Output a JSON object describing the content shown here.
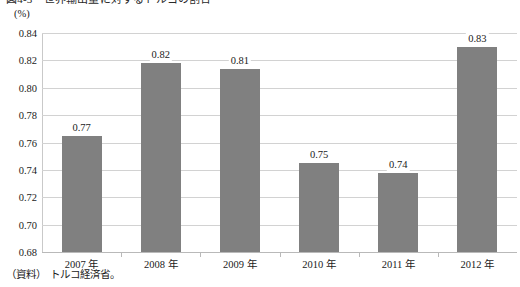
{
  "figure": {
    "title": "図4-3　世界輸出量に対するトルコの割合",
    "unit_label": "(%)",
    "source_label": "（資料）",
    "source_text": "トルコ経済省。"
  },
  "colors": {
    "bar_fill": "#808080",
    "gridline": "#d2d2d2",
    "axis": "#b9b9b9",
    "text": "#1a1a1a",
    "background": "#ffffff"
  },
  "chart_data": {
    "type": "bar",
    "title": "図4-3　世界輸出量に対するトルコの割合",
    "xlabel": "",
    "ylabel": "(%)",
    "ylim": [
      0.68,
      0.84
    ],
    "ytick_step": 0.02,
    "yticks": [
      "0.84",
      "0.82",
      "0.80",
      "0.78",
      "0.76",
      "0.74",
      "0.72",
      "0.70",
      "0.68"
    ],
    "ytick_values": [
      0.84,
      0.82,
      0.8,
      0.78,
      0.76,
      0.74,
      0.72,
      0.7,
      0.68
    ],
    "grid": true,
    "legend": "none",
    "categories": [
      "2007 年",
      "2008 年",
      "2009 年",
      "2010 年",
      "2011 年",
      "2012 年"
    ],
    "values": [
      0.765,
      0.818,
      0.8135,
      0.745,
      0.738,
      0.83
    ],
    "data_labels": [
      "0.77",
      "0.82",
      "0.81",
      "0.75",
      "0.74",
      "0.83"
    ],
    "series": [
      {
        "name": "世界輸出量に対するトルコの割合",
        "values": [
          0.765,
          0.818,
          0.8135,
          0.745,
          0.738,
          0.83
        ]
      }
    ]
  }
}
